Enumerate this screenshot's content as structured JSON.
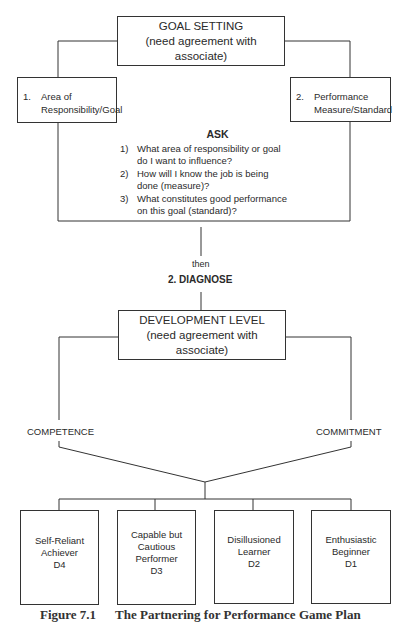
{
  "goal_setting": {
    "title": "GOAL SETTING",
    "subtitle": "(need agreement with associate)",
    "left_box": {
      "number": "1.",
      "line1": "Area of",
      "line2": "Responsibility/Goal"
    },
    "right_box": {
      "number": "2.",
      "line1": "Performance",
      "line2": "Measure/Standard"
    }
  },
  "ask": {
    "title": "ASK",
    "items": [
      {
        "number": "1)",
        "line1": "What area of responsibility or goal",
        "line2": "do I want to influence?"
      },
      {
        "number": "2)",
        "line1": "How will I know the job is being",
        "line2": "done (measure)?"
      },
      {
        "number": "3)",
        "line1": "What constitutes good performance",
        "line2": "on this goal (standard)?"
      }
    ]
  },
  "transition": {
    "then": "then",
    "step": "2. DIAGNOSE"
  },
  "development": {
    "title": "DEVELOPMENT LEVEL",
    "subtitle": "(need agreement with associate)",
    "left_label": "COMPETENCE",
    "right_label": "COMMITMENT"
  },
  "levels": [
    {
      "line1": "Self-Reliant",
      "line2": "Achiever",
      "line3": "",
      "code": "D4"
    },
    {
      "line1": "Capable but",
      "line2": "Cautious",
      "line3": "Performer",
      "code": "D3"
    },
    {
      "line1": "Disillusioned",
      "line2": "Learner",
      "line3": "",
      "code": "D2"
    },
    {
      "line1": "Enthusiastic",
      "line2": "Beginner",
      "line3": "",
      "code": "D1"
    }
  ],
  "caption": {
    "figure": "Figure 7.1",
    "title": "The Partnering for Performance Game Plan"
  }
}
